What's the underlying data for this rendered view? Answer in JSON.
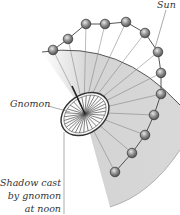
{
  "figure": {
    "labels": {
      "sun": "Sun",
      "gnomon": "Gnomon",
      "shadow_line1": "Shadow cast",
      "shadow_line2": "by gnomon",
      "shadow_line3": "at noon"
    },
    "sun_positions": [
      [
        53,
        50
      ],
      [
        68,
        39
      ],
      [
        86,
        24
      ],
      [
        105,
        24
      ],
      [
        126,
        22
      ],
      [
        145,
        33
      ],
      [
        158,
        52
      ],
      [
        161,
        73
      ],
      [
        161,
        94
      ],
      [
        154,
        115
      ],
      [
        145,
        135
      ],
      [
        132,
        153
      ],
      [
        115,
        172
      ]
    ],
    "dial_center": [
      84,
      112
    ],
    "colors": {
      "sector_fill": "#d6d6d6",
      "sun_fill": "#9a9a9a",
      "line": "#555555"
    }
  }
}
